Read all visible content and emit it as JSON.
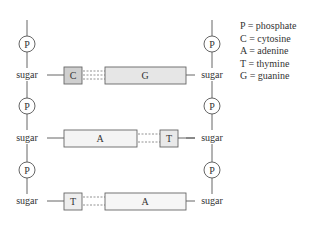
{
  "diagram": {
    "title": "",
    "left_strand": {
      "phosphate_label": "P",
      "sugar_label": "sugar"
    },
    "right_strand": {
      "phosphate_label": "P",
      "sugar_label": "sugar"
    },
    "base_pairs": [
      {
        "left": "C",
        "right": "G",
        "left_size": "small",
        "right_size": "large",
        "left_fill": "#cfcfcf",
        "right_fill": "#e6e6e6"
      },
      {
        "left": "A",
        "right": "T",
        "left_size": "large",
        "right_size": "small",
        "left_fill": "#f4f4f4",
        "right_fill": "#e9e9e9"
      },
      {
        "left": "T",
        "right": "A",
        "left_size": "small",
        "right_size": "large",
        "left_fill": "#eeeeee",
        "right_fill": "#f6f6f6"
      }
    ],
    "legend": [
      "P = phosphate",
      "C = cytosine",
      "A = adenine",
      "T = thymine",
      "G = guanine"
    ]
  }
}
